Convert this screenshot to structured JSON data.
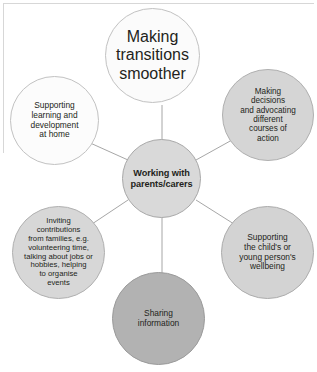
{
  "diagram": {
    "title": "Working with parents/carers",
    "type": "hub-and-spoke-circles",
    "center": {
      "id": "center",
      "label": "Working with\nparents/carers",
      "fill": "#d9d9d9",
      "emphasis": "bold"
    },
    "nodes": [
      {
        "id": "top",
        "label": "Making\ntransitions\nsmoother",
        "fill": "#fbfbfb",
        "position": "top"
      },
      {
        "id": "right-top",
        "label": "Making\ndecisions\nand advocating\ndifferent\ncourses of\naction",
        "fill": "#d5d5d5",
        "position": "upper-right"
      },
      {
        "id": "right-bottom",
        "label": "Supporting\nthe child's or\nyoung person's\nwellbeing",
        "fill": "#d3d3d3",
        "position": "lower-right"
      },
      {
        "id": "bottom",
        "label": "Sharing\ninformation",
        "fill": "#b2b2b2",
        "position": "bottom"
      },
      {
        "id": "left-bottom",
        "label": "Inviting\ncontributions\nfrom families, e.g.\nvolunteering time,\ntalking about jobs or\nhobbies, helping\nto organise\nevents",
        "fill": "#d7d7d7",
        "position": "lower-left"
      },
      {
        "id": "left-top",
        "label": "Supporting\nlearning and\ndevelopment\nat home",
        "fill": "#fcfcfc",
        "position": "upper-left"
      }
    ],
    "connector_color": "#9c9c9c"
  }
}
